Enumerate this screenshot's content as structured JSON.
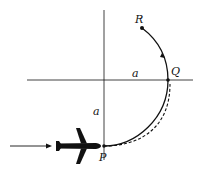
{
  "diagram": {
    "points": {
      "P": {
        "label": "P",
        "x": 104,
        "y": 146
      },
      "Q": {
        "label": "Q",
        "x": 168,
        "y": 80
      },
      "R": {
        "label": "R",
        "x": 142,
        "y": 28
      }
    },
    "dimension_labels": {
      "horizontal": "a",
      "vertical": "a"
    },
    "colors": {
      "ink": "#111111",
      "background": "#ffffff"
    },
    "elements": [
      "horizontal axis",
      "vertical axis",
      "solid circular arc P to Q to R with direction arrow",
      "dashed alternate path P to Q",
      "airplane silhouette approaching P from left",
      "incoming arrow"
    ]
  }
}
